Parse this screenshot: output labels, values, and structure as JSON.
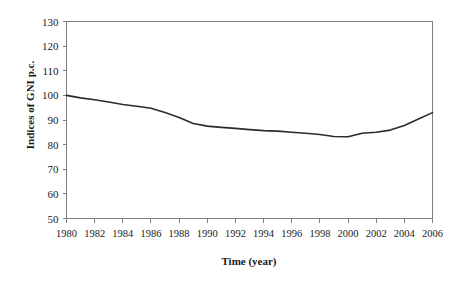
{
  "chart_data": {
    "type": "line",
    "title": "",
    "xlabel": "Time (year)",
    "ylabel": "Indices of GNI p.c.",
    "xlim": [
      1980,
      2006
    ],
    "ylim": [
      50,
      130
    ],
    "grid": false,
    "legend": "none",
    "y_ticks": [
      50,
      60,
      70,
      80,
      90,
      100,
      110,
      120,
      130
    ],
    "x_ticks": [
      1980,
      1982,
      1984,
      1986,
      1988,
      1990,
      1992,
      1994,
      1996,
      1998,
      2000,
      2002,
      2004,
      2006
    ],
    "x_tick_labels": [
      "1980",
      "1982",
      "1984",
      "1986",
      "1988",
      "1990",
      "1992",
      "1994",
      "1996",
      "1998",
      "2000",
      "2002",
      "2004",
      "2006"
    ],
    "y_tick_labels": [
      "130",
      "120",
      "110",
      "100",
      "90",
      "80",
      "70",
      "60",
      "50"
    ],
    "series": [
      {
        "name": "Indices of GNI p.c.",
        "color": "#2b2b2b",
        "x": [
          1980,
          1981,
          1982,
          1983,
          1984,
          1985,
          1986,
          1987,
          1988,
          1989,
          1990,
          1991,
          1992,
          1993,
          1994,
          1995,
          1996,
          1997,
          1998,
          1999,
          2000,
          2001,
          2002,
          2003,
          2004,
          2005,
          2006
        ],
        "values": [
          100.0,
          99.0,
          98.2,
          97.3,
          96.3,
          95.6,
          94.8,
          93.0,
          91.0,
          88.6,
          87.5,
          87.0,
          86.6,
          86.1,
          85.7,
          85.5,
          85.0,
          84.6,
          84.1,
          83.3,
          83.2,
          84.6,
          85.0,
          85.9,
          87.8,
          90.4,
          93.0
        ]
      }
    ]
  },
  "axes": {
    "frame_color": "#808080",
    "text_color": "#1a1a1a"
  }
}
